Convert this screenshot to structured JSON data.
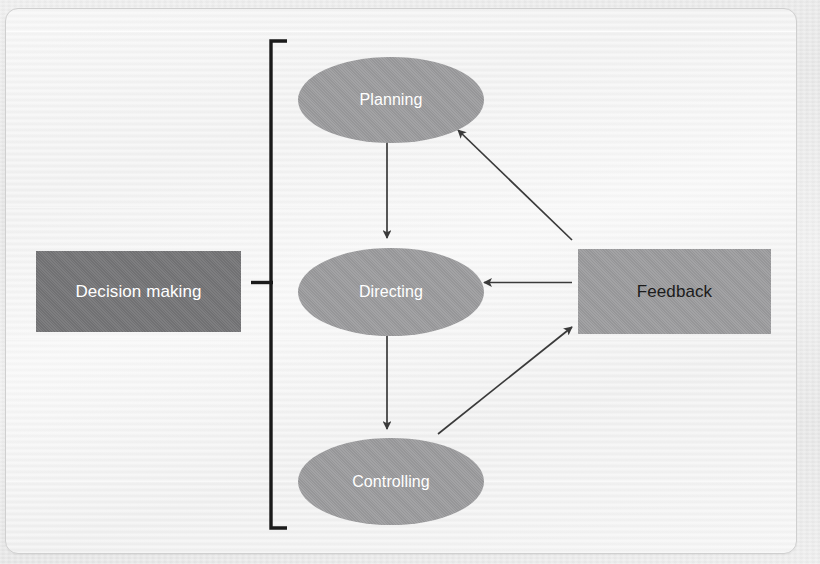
{
  "figure": {
    "nodes": {
      "decision_making": {
        "label": "Decision making",
        "shape": "rectangle",
        "fill": "#777779",
        "text_color": "#ffffff"
      },
      "feedback": {
        "label": "Feedback",
        "shape": "rectangle",
        "fill": "#9d9d9f",
        "text_color": "#1c1c1c"
      },
      "planning": {
        "label": "Planning",
        "shape": "ellipse",
        "fill": "#9d9d9f",
        "text_color": "#ffffff"
      },
      "directing": {
        "label": "Directing",
        "shape": "ellipse",
        "fill": "#9d9d9f",
        "text_color": "#ffffff"
      },
      "controlling": {
        "label": "Controlling",
        "shape": "ellipse",
        "fill": "#9d9d9f",
        "text_color": "#ffffff"
      }
    },
    "bracket": {
      "label": "grouping-bracket",
      "orientation": "left-facing",
      "groups": [
        "Planning",
        "Directing",
        "Controlling"
      ],
      "color": "#1a1a1a"
    },
    "connectors": [
      {
        "from": "Planning",
        "to": "Directing",
        "style": "straight-vertical",
        "direction": "down"
      },
      {
        "from": "Directing",
        "to": "Controlling",
        "style": "straight-vertical",
        "direction": "down"
      },
      {
        "from": "Feedback",
        "to": "Directing",
        "style": "straight-horizontal",
        "direction": "left"
      },
      {
        "from": "Feedback",
        "to": "Planning",
        "style": "diagonal",
        "direction": "up-left"
      },
      {
        "from": "Controlling",
        "to": "Feedback",
        "style": "diagonal",
        "direction": "up-right"
      }
    ],
    "colors": {
      "frame_border": "#cfcfcf",
      "page_background": "#e8e8e8",
      "figure_background": "#f2f2f2",
      "connector": "#3a3a3a"
    }
  },
  "ghost_text": {
    "line_1": "Unit Cost",
    "line_2": "amount",
    "line_3": "the cost",
    "line_4": "product"
  }
}
